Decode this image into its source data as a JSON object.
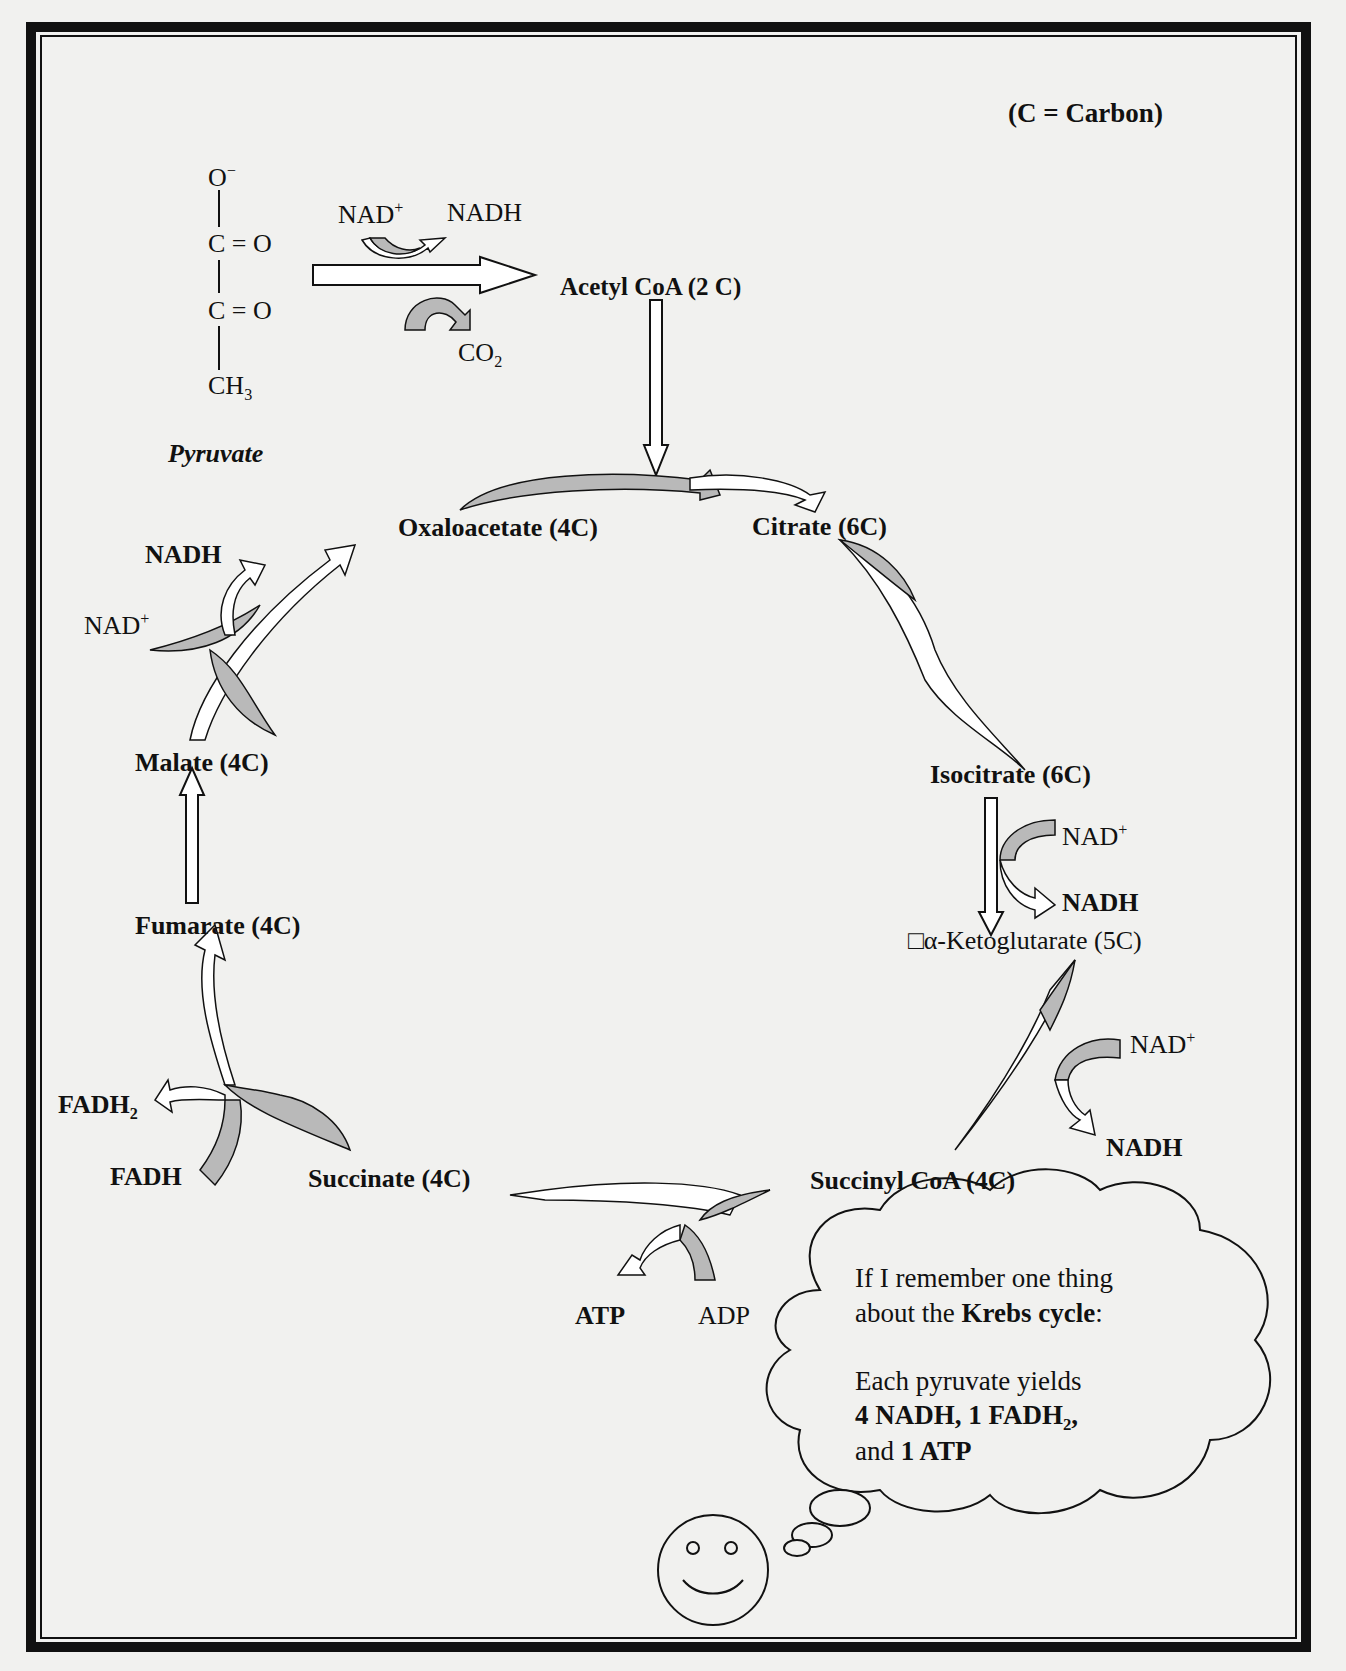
{
  "legend": {
    "carbon_note": "(C = Carbon)"
  },
  "pyruvate": {
    "name": "Pyruvate",
    "structure": {
      "top": "O",
      "top_charge": "−",
      "c1": "C = O",
      "c2": "C = O",
      "bottom": "CH",
      "bottom_sub": "3"
    }
  },
  "decarboxylation": {
    "nad_in": "NAD",
    "nad_in_sup": "+",
    "nadh_out": "NADH",
    "co2": "CO",
    "co2_sub": "2",
    "product": "Acetyl CoA (2 C)"
  },
  "cycle": {
    "oxaloacetate": "Oxaloacetate (4C)",
    "citrate": "Citrate (6C)",
    "isocitrate": "Isocitrate (6C)",
    "alpha_kg": "□α-Ketoglutarate (5C)",
    "succinyl_coa": "Succinyl CoA (4C)",
    "succinate": "Succinate (4C)",
    "fumarate": "Fumarate (4C)",
    "malate": "Malate (4C)"
  },
  "cofactors": {
    "iso_nad": "NAD",
    "iso_nad_sup": "+",
    "iso_nadh": "NADH",
    "akg_nad": "NAD",
    "akg_nad_sup": "+",
    "akg_nadh": "NADH",
    "atp": "ATP",
    "adp": "ADP",
    "fadh2": "FADH",
    "fadh2_sub": "2",
    "fadh": "FADH",
    "mal_nad": "NAD",
    "mal_nad_sup": "+",
    "mal_nadh": "NADH"
  },
  "thought_bubble": {
    "line1": "If I remember one thing",
    "line2_pre": "about the ",
    "line2_bold": "Krebs cycle",
    "line2_post": ":",
    "line3": "Each pyruvate yields",
    "line4": "4 NADH, 1 FADH",
    "line4_sub": "2",
    "line4_post": ",",
    "line5_pre": "and ",
    "line5_bold": "1 ATP"
  },
  "colors": {
    "shade": "#b9b9b9",
    "ink": "#111111",
    "paper": "#f1f1ef"
  }
}
